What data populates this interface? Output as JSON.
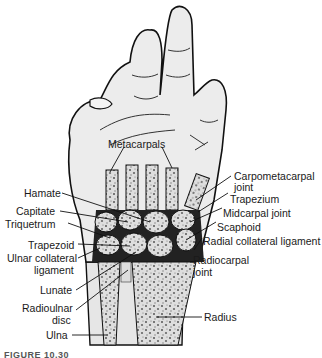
{
  "figure": {
    "caption": "FIGURE 10.30"
  },
  "labels": {
    "metacarpals": "Metacarpals",
    "carpometacarpal_joint_1": "Carpometacarpal",
    "carpometacarpal_joint_2": "joint",
    "hamate": "Hamate",
    "trapezium": "Trapezium",
    "capitate": "Capitate",
    "midcarpal_joint": "Midcarpal joint",
    "triquetrum": "Triquetrum",
    "scaphoid": "Scaphoid",
    "trapezoid": "Trapezoid",
    "radial_collateral_ligament": "Radial collateral ligament",
    "ulnar_collateral_ligament_1": "Ulnar collateral",
    "ulnar_collateral_ligament_2": "ligament",
    "radiocarpal_joint_1": "Radiocarpal",
    "radiocarpal_joint_2": "joint",
    "lunate": "Lunate",
    "radioulnar_disc_1": "Radioulnar",
    "radioulnar_disc_2": "disc",
    "radius": "Radius",
    "ulna": "Ulna"
  },
  "colors": {
    "skin": "#e9e9e9",
    "outline": "#111111",
    "bone": "#dcdcdc",
    "bone_speckle": "#555555",
    "text": "#1a1a1a"
  }
}
